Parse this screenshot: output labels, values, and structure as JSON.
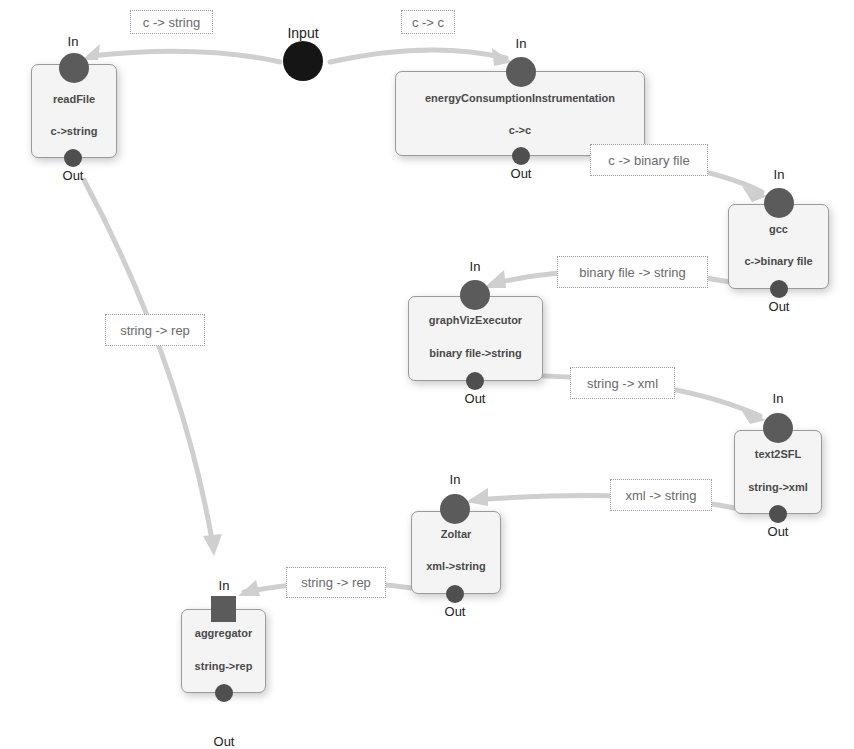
{
  "diagram": {
    "source": {
      "label": "Input"
    },
    "port_labels": {
      "in": "In",
      "out": "Out"
    },
    "nodes": [
      {
        "id": "readFile",
        "name": "readFile",
        "type": "c->string"
      },
      {
        "id": "energyConsumptionInstrumentation",
        "name": "energyConsumptionInstrumentation",
        "type": "c->c"
      },
      {
        "id": "gcc",
        "name": "gcc",
        "type": "c->binary file"
      },
      {
        "id": "graphVizExecutor",
        "name": "graphVizExecutor",
        "type": "binary file->string"
      },
      {
        "id": "text2SFL",
        "name": "text2SFL",
        "type": "string->xml"
      },
      {
        "id": "Zoltar",
        "name": "Zoltar",
        "type": "xml->string"
      },
      {
        "id": "aggregator",
        "name": "aggregator",
        "type": "string->rep"
      }
    ],
    "edges": [
      {
        "from": "Input",
        "to": "readFile",
        "label": "c -> string"
      },
      {
        "from": "Input",
        "to": "energyConsumptionInstrumentation",
        "label": "c -> c"
      },
      {
        "from": "energyConsumptionInstrumentation",
        "to": "gcc",
        "label": "c -> binary file"
      },
      {
        "from": "gcc",
        "to": "graphVizExecutor",
        "label": "binary file -> string"
      },
      {
        "from": "graphVizExecutor",
        "to": "text2SFL",
        "label": "string -> xml"
      },
      {
        "from": "text2SFL",
        "to": "Zoltar",
        "label": "xml -> string"
      },
      {
        "from": "Zoltar",
        "to": "aggregator",
        "label": "string -> rep"
      },
      {
        "from": "readFile",
        "to": "aggregator",
        "label": "string -> rep"
      }
    ],
    "colors": {
      "edge": "#cfcfcf",
      "port": "#5b5b5b",
      "source": "#151515",
      "node_fill": "#f4f4f4",
      "node_border": "#9a9a9a"
    }
  }
}
